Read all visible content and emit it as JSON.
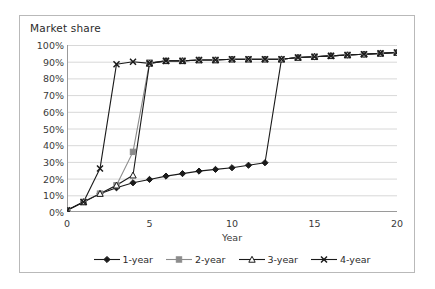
{
  "chart_data": {
    "type": "line",
    "title": "Market share",
    "xlabel": "Year",
    "ylabel": "",
    "xlim": [
      0,
      20
    ],
    "ylim": [
      0,
      1
    ],
    "grid": true,
    "legend_position": "bottom",
    "x_ticks": [
      "0",
      "5",
      "10",
      "15",
      "20"
    ],
    "x_tick_values": [
      0,
      5,
      10,
      15,
      20
    ],
    "y_ticks": [
      "0%",
      "10%",
      "20%",
      "30%",
      "40%",
      "50%",
      "60%",
      "70%",
      "80%",
      "90%",
      "100%"
    ],
    "y_tick_values": [
      0,
      0.1,
      0.2,
      0.3,
      0.4,
      0.5,
      0.6,
      0.7,
      0.8,
      0.9,
      1.0
    ],
    "x": [
      0,
      1,
      2,
      3,
      4,
      5,
      6,
      7,
      8,
      9,
      10,
      11,
      12,
      13,
      14,
      15,
      16,
      17,
      18,
      19,
      20
    ],
    "series": [
      {
        "name": "1-year",
        "marker": "diamond",
        "color": "#1a1a1a",
        "values": [
          0.01,
          0.06,
          0.11,
          0.145,
          0.175,
          0.195,
          0.215,
          0.23,
          0.245,
          0.255,
          0.265,
          0.28,
          0.295,
          0.915,
          0.925,
          0.93,
          0.935,
          0.94,
          0.945,
          0.95,
          0.955
        ]
      },
      {
        "name": "2-year",
        "marker": "square",
        "color": "#8c8c8c",
        "values": [
          0.01,
          0.06,
          0.11,
          0.16,
          0.36,
          0.895,
          0.905,
          0.905,
          0.91,
          0.91,
          0.915,
          0.915,
          0.915,
          0.915,
          0.925,
          0.93,
          0.935,
          0.94,
          0.945,
          0.95,
          0.955
        ]
      },
      {
        "name": "3-year",
        "marker": "triangle",
        "color": "#1a1a1a",
        "values": [
          0.01,
          0.06,
          0.11,
          0.16,
          0.22,
          0.89,
          0.905,
          0.905,
          0.91,
          0.91,
          0.915,
          0.915,
          0.915,
          0.915,
          0.925,
          0.93,
          0.935,
          0.94,
          0.945,
          0.95,
          0.955
        ]
      },
      {
        "name": "4-year",
        "marker": "x",
        "color": "#1a1a1a",
        "values": [
          0.01,
          0.06,
          0.26,
          0.885,
          0.9,
          0.89,
          0.905,
          0.905,
          0.91,
          0.91,
          0.915,
          0.915,
          0.915,
          0.915,
          0.925,
          0.93,
          0.935,
          0.94,
          0.945,
          0.95,
          0.955
        ]
      }
    ]
  }
}
